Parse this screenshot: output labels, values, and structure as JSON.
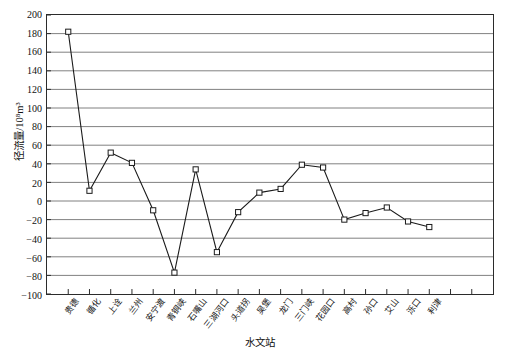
{
  "chart_data": {
    "type": "line",
    "title": "",
    "xlabel": "水文站",
    "ylabel": "径流量/10⁸m³",
    "ylim": [
      -100,
      200
    ],
    "ytick_step": 20,
    "yticks": [
      200,
      180,
      160,
      140,
      120,
      100,
      80,
      60,
      40,
      20,
      0,
      -20,
      -40,
      -60,
      -80,
      -100
    ],
    "grid": "horizontal",
    "legend": "none",
    "marker": "open-square",
    "line_color": "#1a1a1a",
    "grid_color": "#808080",
    "frame_color": "#2b2b2b",
    "categories": [
      "贵德",
      "循化",
      "上诠",
      "兰州",
      "安宁渡",
      "青铜峡",
      "石嘴山",
      "三湖河口",
      "头道拐",
      "吴堡",
      "龙门",
      "三门峡",
      "花园口",
      "高村",
      "孙口",
      "艾山",
      "泺口",
      "利津"
    ],
    "values": [
      182,
      11,
      52,
      41,
      -10,
      -77,
      34,
      -55,
      -12,
      9,
      13,
      39,
      36,
      -20,
      -13,
      -7,
      -22,
      -28
    ]
  }
}
